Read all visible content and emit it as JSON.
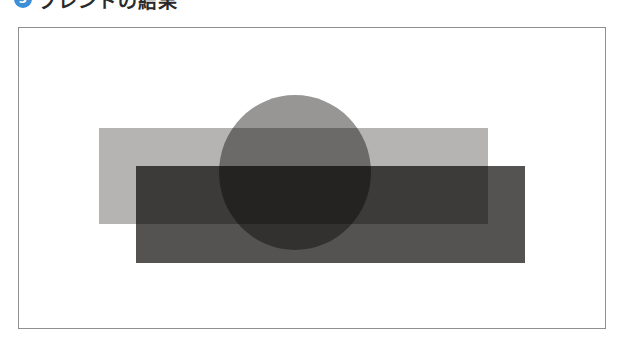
{
  "heading": {
    "number": "3",
    "number_icon": "circled-number-icon",
    "title": "ブレンドの結果"
  },
  "figure": {
    "frame_border_color": "#8f8f8f",
    "background_color": "#ffffff",
    "shapes": [
      {
        "name": "light-gray-rectangle",
        "type": "rect",
        "x": 99,
        "y": 128,
        "width": 389,
        "height": 96,
        "color": "#b5b4b2"
      },
      {
        "name": "dark-gray-rectangle",
        "type": "rect",
        "x": 136,
        "y": 166,
        "width": 389,
        "height": 97,
        "color": "#555352",
        "blend": "multiply"
      },
      {
        "name": "gray-circle",
        "type": "ellipse",
        "cx": 295,
        "cy": 172,
        "width": 152,
        "height": 155,
        "color": "#858382",
        "blend": "multiply"
      }
    ],
    "overlap_colors": {
      "circle_over_light": "#757372",
      "dark_over_light": "#4d4a49",
      "circle_over_dark": "#474241",
      "circle_over_dark_and_light": "#3f3838"
    }
  },
  "colors": {
    "accent": "#3a8fd8",
    "text": "#2a2a2a"
  }
}
